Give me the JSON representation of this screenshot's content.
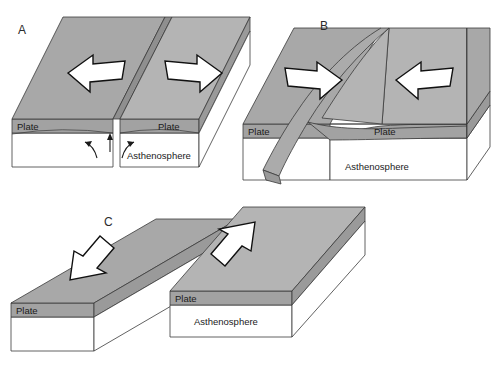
{
  "figure": {
    "background_color": "#ffffff",
    "ink_color": "#1a1a1a",
    "plate_fill": "#a8a8a8",
    "asthenosphere_fill": "#ffffff"
  },
  "panels": [
    {
      "id": "A",
      "label": "A",
      "boundary_type": "divergent",
      "labels": {
        "plate_left": "Plate",
        "plate_right": "Plate",
        "asthenosphere": "Asthenosphere"
      },
      "arrows": [
        {
          "name": "left-plate-motion-arrow",
          "direction": "left"
        },
        {
          "name": "right-plate-motion-arrow",
          "direction": "right"
        }
      ],
      "convection_arrows": [
        {
          "name": "convection-arrow-left",
          "direction": "up-left"
        },
        {
          "name": "convection-arrow-right",
          "direction": "up-right"
        },
        {
          "name": "upwelling-arrow-center",
          "direction": "up"
        }
      ]
    },
    {
      "id": "B",
      "label": "B",
      "boundary_type": "convergent",
      "labels": {
        "plate_left": "Plate",
        "plate_right": "Plate",
        "asthenosphere": "Asthenosphere"
      },
      "arrows": [
        {
          "name": "left-plate-motion-arrow",
          "direction": "right"
        },
        {
          "name": "right-plate-motion-arrow",
          "direction": "left"
        }
      ],
      "features": [
        {
          "name": "subducting-slab",
          "description": "descending plate curving into asthenosphere"
        }
      ]
    },
    {
      "id": "C",
      "label": "C",
      "boundary_type": "transform",
      "labels": {
        "plate_left": "Plate",
        "plate_right": "Plate",
        "asthenosphere": "Asthenosphere"
      },
      "arrows": [
        {
          "name": "left-plate-motion-arrow",
          "direction": "down-left"
        },
        {
          "name": "right-plate-motion-arrow",
          "direction": "up-right"
        }
      ]
    }
  ]
}
